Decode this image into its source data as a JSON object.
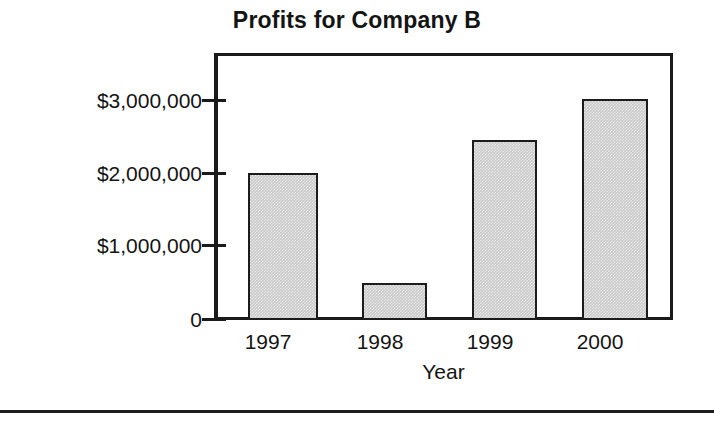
{
  "chart_data": {
    "type": "bar",
    "title": "Profits for Company B",
    "xlabel": "Year",
    "ylabel": "",
    "categories": [
      "1997",
      "1998",
      "1999",
      "2000"
    ],
    "values": [
      2000000,
      500000,
      2450000,
      3000000
    ],
    "ylim": [
      0,
      3300000
    ],
    "yticks": [
      0,
      1000000,
      2000000,
      3000000
    ],
    "ytick_labels": [
      "0",
      "$1,000,000",
      "$2,000,000",
      "$3,000,000"
    ],
    "grid": false,
    "legend": false,
    "bar_fill_color": "#c9c9c9",
    "bar_edge_color": "#1c1c1c",
    "axis_color": "#1a1a1a",
    "background_color": "#ffffff",
    "bars": [
      {
        "category": "1997",
        "value": 2000000,
        "left_px": 34,
        "width_px": 70
      },
      {
        "category": "1998",
        "value": 500000,
        "left_px": 148,
        "width_px": 65
      },
      {
        "category": "1999",
        "value": 2450000,
        "left_px": 258,
        "width_px": 65
      },
      {
        "category": "2000",
        "value": 3000000,
        "left_px": 368,
        "width_px": 66
      }
    ]
  },
  "axes": {
    "y_ticks": [
      {
        "label": "$3,000,000",
        "top_px": 89
      },
      {
        "label": "$2,000,000",
        "top_px": 162
      },
      {
        "label": "$1,000,000",
        "top_px": 234
      },
      {
        "label": "0",
        "top_px": 308
      }
    ],
    "y_tick_marks": [
      {
        "top_px": 99
      },
      {
        "top_px": 172
      },
      {
        "top_px": 244
      },
      {
        "top_px": 318
      }
    ],
    "x_labels": [
      {
        "label": "1997",
        "left_px": 218,
        "width_px": 100
      },
      {
        "label": "1998",
        "left_px": 330,
        "width_px": 100
      },
      {
        "label": "1999",
        "left_px": 440,
        "width_px": 100
      },
      {
        "label": "2000",
        "left_px": 550,
        "width_px": 100
      }
    ],
    "x_title": "Year"
  }
}
